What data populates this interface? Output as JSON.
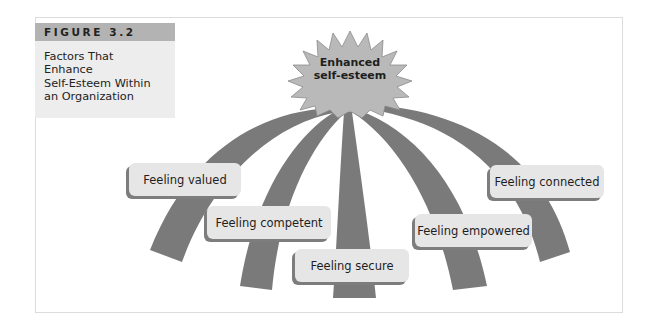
{
  "figure": {
    "number_label": "FIGURE 3.2",
    "caption_lines": [
      "Factors That",
      "Enhance",
      "Self-Esteem Within",
      "an Organization"
    ]
  },
  "diagram": {
    "center": {
      "shape": "starburst",
      "lines": [
        "Enhanced",
        "self-esteem"
      ]
    },
    "factors": [
      {
        "id": "valued",
        "label": "Feeling valued"
      },
      {
        "id": "competent",
        "label": "Feeling competent"
      },
      {
        "id": "secure",
        "label": "Feeling secure"
      },
      {
        "id": "empowered",
        "label": "Feeling empowered"
      },
      {
        "id": "connected",
        "label": "Feeling connected"
      }
    ],
    "colors": {
      "starburst_fill": "#b9b9b9",
      "starburst_stroke": "#8a8a8a",
      "arc_fill": "#7a7a7a",
      "label_box_fill": "#e6e6e6",
      "label_box_shadow": "#7d7d7d",
      "title_bar": "#b3b3b3",
      "caption_panel": "#ededed"
    }
  }
}
